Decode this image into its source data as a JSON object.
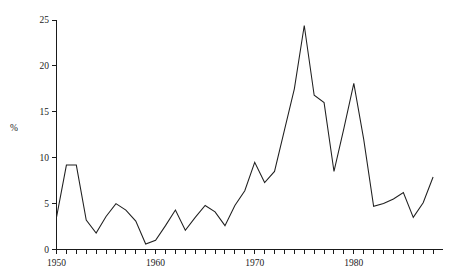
{
  "chart_data": {
    "type": "line",
    "title": "",
    "subtitle": "",
    "xlabel": "",
    "ylabel": "%",
    "xlim": [
      1950,
      1988
    ],
    "ylim": [
      0,
      25
    ],
    "grid": false,
    "legend": null,
    "y_ticks": [
      0,
      5,
      10,
      15,
      20,
      25
    ],
    "y_tick_labels": [
      "0",
      "5",
      "10",
      "15",
      "20",
      "25"
    ],
    "x_ticks": [
      1950,
      1951,
      1952,
      1953,
      1954,
      1955,
      1956,
      1957,
      1958,
      1959,
      1960,
      1961,
      1962,
      1963,
      1964,
      1965,
      1966,
      1967,
      1968,
      1969,
      1970,
      1971,
      1972,
      1973,
      1974,
      1975,
      1976,
      1977,
      1978,
      1979,
      1980,
      1981,
      1982,
      1983,
      1984,
      1985,
      1986,
      1987,
      1988
    ],
    "x_tick_labels_shown": [
      "1950",
      "1960",
      "1970",
      "1980"
    ],
    "x_labeled_ticks": [
      1950,
      1960,
      1970,
      1980
    ],
    "x": [
      1950,
      1951,
      1952,
      1953,
      1954,
      1955,
      1956,
      1957,
      1958,
      1959,
      1960,
      1961,
      1962,
      1963,
      1964,
      1965,
      1966,
      1967,
      1968,
      1969,
      1970,
      1971,
      1972,
      1973,
      1974,
      1975,
      1976,
      1977,
      1978,
      1979,
      1980,
      1981,
      1982,
      1983,
      1984,
      1985,
      1986,
      1987,
      1988
    ],
    "values": [
      3.5,
      9.2,
      9.2,
      3.2,
      1.8,
      3.6,
      5.0,
      4.3,
      3.1,
      0.6,
      1.0,
      2.6,
      4.3,
      2.1,
      3.5,
      4.8,
      4.1,
      2.6,
      4.8,
      6.4,
      9.5,
      7.3,
      8.5,
      13.0,
      17.5,
      24.4,
      16.8,
      16.0,
      8.5,
      13.2,
      18.1,
      12.0,
      4.7,
      5.0,
      5.5,
      6.2,
      3.5,
      5.1,
      7.9
    ],
    "series": [
      {
        "name": "%",
        "color": "#1f1f1f",
        "values": [
          3.5,
          9.2,
          9.2,
          3.2,
          1.8,
          3.6,
          5.0,
          4.3,
          3.1,
          0.6,
          1.0,
          2.6,
          4.3,
          2.1,
          3.5,
          4.8,
          4.1,
          2.6,
          4.8,
          6.4,
          9.5,
          7.3,
          8.5,
          13.0,
          17.5,
          24.4,
          16.8,
          16.0,
          8.5,
          13.2,
          18.1,
          12.0,
          4.7,
          5.0,
          5.5,
          6.2,
          3.5,
          5.1,
          7.9
        ]
      }
    ],
    "annotations": []
  },
  "colors": {
    "background": "#ffffff",
    "axis": "#1a1a1a",
    "line": "#1f1f1f",
    "text": "#1a1a1a"
  }
}
